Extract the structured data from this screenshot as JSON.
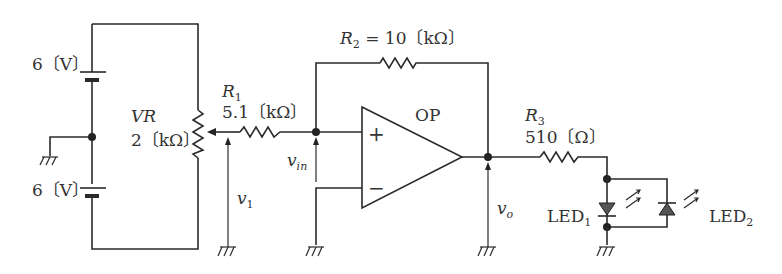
{
  "diagram": {
    "type": "op-amp non-inverting amplifier with LED indicator",
    "batteries": [
      {
        "label": "6〔V〕"
      },
      {
        "label": "6〔V〕"
      }
    ],
    "vr": {
      "name": "VR",
      "value": "2〔kΩ〕"
    },
    "r1": {
      "name": "R",
      "sub": "1",
      "value": "5.1〔kΩ〕"
    },
    "r2": {
      "name": "R",
      "sub": "2",
      "value": "= 10〔kΩ〕"
    },
    "r3": {
      "name": "R",
      "sub": "3",
      "value": "510〔Ω〕"
    },
    "opamp": {
      "label": "OP",
      "plus": "+",
      "minus": "−"
    },
    "voltages": {
      "v1": {
        "name": "v",
        "sub": "1"
      },
      "vin": {
        "name": "v",
        "sub": "in"
      },
      "vo": {
        "name": "v",
        "sub": "o"
      }
    },
    "leds": [
      {
        "name": "LED",
        "sub": "1"
      },
      {
        "name": "LED",
        "sub": "2"
      }
    ]
  }
}
